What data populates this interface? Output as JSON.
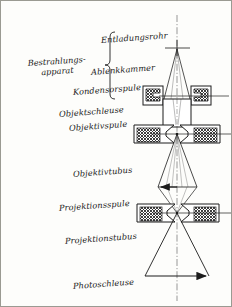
{
  "diagram": {
    "language": "de",
    "bracket_label_line1": "Bestrahlungs-",
    "bracket_label_line2": "apparat",
    "labels": [
      {
        "id": "entladungsrohr",
        "text": "Entladungsrohr",
        "x": 100,
        "y": 40,
        "align": "left"
      },
      {
        "id": "ablenkkammer",
        "text": "Ablenkkammer",
        "x": 92,
        "y": 72,
        "align": "left"
      },
      {
        "id": "kondensorspule",
        "text": "Kondensorspule",
        "x": 78,
        "y": 92,
        "align": "left"
      },
      {
        "id": "objektschleuse",
        "text": "Objektschleuse",
        "x": 62,
        "y": 114,
        "align": "left"
      },
      {
        "id": "objektivspule",
        "text": "Objektivspule",
        "x": 72,
        "y": 128,
        "align": "left"
      },
      {
        "id": "objektivtubus",
        "text": "Objektivtubus",
        "x": 74,
        "y": 172,
        "align": "left"
      },
      {
        "id": "projektionsspule",
        "text": "Projektionsspule",
        "x": 64,
        "y": 207,
        "align": "left"
      },
      {
        "id": "projektionstubus",
        "text": "Projektionstubus",
        "x": 68,
        "y": 240,
        "align": "left"
      },
      {
        "id": "photoschleuse",
        "text": "Photoschleuse",
        "x": 74,
        "y": 285,
        "align": "left"
      }
    ],
    "components": [
      {
        "id": "discharge-tube",
        "type": "source",
        "label": "Entladungsrohr"
      },
      {
        "id": "deflection-chamber",
        "type": "chamber",
        "label": "Ablenkkammer"
      },
      {
        "id": "condenser-coil",
        "type": "lens-coil",
        "label": "Kondensorspule"
      },
      {
        "id": "specimen-airlock",
        "type": "airlock",
        "label": "Objektschleuse"
      },
      {
        "id": "objective-coil",
        "type": "lens-coil",
        "label": "Objektivspule"
      },
      {
        "id": "objective-tube",
        "type": "tube",
        "label": "Objektivtubus"
      },
      {
        "id": "projector-coil",
        "type": "lens-coil",
        "label": "Projektionsspule"
      },
      {
        "id": "projector-tube",
        "type": "tube",
        "label": "Projektionstubus"
      },
      {
        "id": "photo-airlock",
        "type": "airlock",
        "label": "Photoschleuse"
      }
    ],
    "colors": {
      "ink": "#1c1c1c",
      "hatch": "#3a3a3a",
      "paper": "#fdfdfb",
      "frame": "#9a9a92"
    },
    "axis": {
      "type": "dash-dot",
      "x": 176
    }
  }
}
